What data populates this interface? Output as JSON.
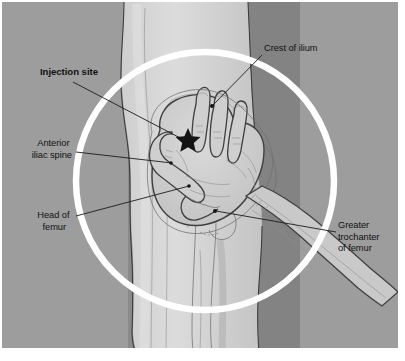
{
  "figure": {
    "canvas": {
      "width": 405,
      "height": 361
    },
    "panel": {
      "x": 2,
      "y": 2,
      "width": 396,
      "height": 346
    },
    "colors": {
      "page_background": "#ffffff",
      "panel_background": "#9d9d9d",
      "panel_shadow": "#848484",
      "body_light": "#d6d6d6",
      "body_midlight": "#c6c6c6",
      "body_mid": "#bcbcbc",
      "hand_fill": "#cdcdcd",
      "circle_stroke": "#ffffff",
      "outline": "#3a3a3a",
      "label_text": "#111111",
      "leader_line": "#1b1b1b",
      "marker_star": "#141414"
    }
  },
  "overlay_circle": {
    "name": "injection-region-circle",
    "center_x": 205,
    "center_y": 181,
    "radius": 129,
    "stroke_width": 6.5,
    "stroke_color": "#ffffff"
  },
  "marker": {
    "name": "injection-site-star",
    "shape": "five-pointed-star",
    "x": 188,
    "y": 139,
    "size": 11,
    "color": "#141414"
  },
  "labels": [
    {
      "id": "crest-of-ilium",
      "text": "Crest of ilium",
      "lines": [
        "Crest of ilium"
      ],
      "bold": false,
      "anchor": "start",
      "text_x": 264,
      "text_y": 51,
      "align": "left",
      "leader": {
        "x1": 262,
        "y1": 55,
        "x2": 213,
        "y2": 105
      },
      "dot": {
        "x": 212,
        "y": 106,
        "r": 2.0
      }
    },
    {
      "id": "injection-site",
      "text": "Injection site",
      "lines": [
        "Injection site"
      ],
      "bold": true,
      "anchor": "start",
      "text_x": 40,
      "text_y": 75,
      "align": "left",
      "leader": {
        "x1": 73,
        "y1": 82,
        "x2": 186,
        "y2": 141
      },
      "dot": null
    },
    {
      "id": "anterior-iliac-spine",
      "text": "Anterior iliac spine",
      "lines": [
        "Anterior",
        "iliac spine"
      ],
      "bold": false,
      "anchor": "end",
      "text_x": 72,
      "text_y": 146,
      "align": "right",
      "leader": {
        "x1": 76,
        "y1": 152,
        "x2": 172,
        "y2": 163
      },
      "dot": {
        "x": 171,
        "y": 163,
        "r": 1.8
      }
    },
    {
      "id": "head-of-femur",
      "text": "Head of femur",
      "lines": [
        "Head of",
        "femur"
      ],
      "bold": false,
      "anchor": "end",
      "text_x": 72,
      "text_y": 218,
      "align": "right",
      "leader": {
        "x1": 76,
        "y1": 216,
        "x2": 189,
        "y2": 186
      },
      "dot": {
        "x": 189,
        "y": 186,
        "r": 1.8
      }
    },
    {
      "id": "greater-trochanter-of-femur",
      "text": "Greater trochanter of femur",
      "lines": [
        "Greater",
        "trochanter",
        "of femur"
      ],
      "bold": false,
      "anchor": "start",
      "text_x": 338,
      "text_y": 228,
      "align": "left",
      "leader": {
        "x1": 336,
        "y1": 232,
        "x2": 216,
        "y2": 211
      },
      "dot": {
        "x": 215,
        "y": 211,
        "r": 2.0
      }
    }
  ],
  "anatomy_parts": [
    {
      "id": "torso",
      "name": "torso-and-thigh-silhouette"
    },
    {
      "id": "shadow-band",
      "name": "background-shadow-band"
    },
    {
      "id": "hand",
      "name": "hand-landmark-overlay"
    },
    {
      "id": "forearm",
      "name": "forearm"
    },
    {
      "id": "pelvis",
      "name": "pelvic-bone-outline"
    },
    {
      "id": "femur",
      "name": "femur-outline"
    }
  ]
}
